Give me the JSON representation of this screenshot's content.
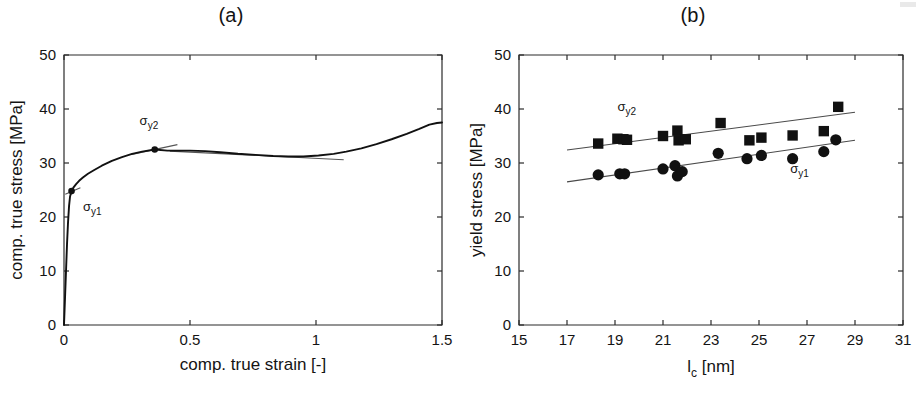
{
  "figure": {
    "background": "#ffffff",
    "ink_color": "#141414"
  },
  "panels": [
    {
      "id": "panel-a",
      "title": "(a)",
      "xlabel": "comp. true strain [-]",
      "ylabel": "comp. true stress [MPa]",
      "xlim": [
        0,
        1.5
      ],
      "ylim": [
        0,
        50
      ],
      "xticks": [
        0,
        0.5,
        1,
        1.5
      ],
      "xticklabels": [
        "0",
        "0.5",
        "1",
        "1.5"
      ],
      "yticks": [
        0,
        10,
        20,
        30,
        40,
        50
      ],
      "yticklabels": [
        "0",
        "10",
        "20",
        "30",
        "40",
        "50"
      ],
      "annotations": [
        {
          "name": "sigma-y1",
          "symbol": "σ",
          "subscript": "y1",
          "point": [
            0.03,
            24.8
          ],
          "label_pos": [
            0.075,
            21.2
          ]
        },
        {
          "name": "sigma-y2",
          "symbol": "σ",
          "subscript": "y2",
          "point": [
            0.36,
            32.5
          ],
          "label_pos": [
            0.3,
            37.0
          ]
        }
      ]
    },
    {
      "id": "panel-b",
      "title": "(b)",
      "xlabel": "l_c [nm]",
      "xlabel_main": "l",
      "xlabel_sub": "c",
      "xlabel_unit": "[nm]",
      "ylabel": "yield stress [MPa]",
      "xlim": [
        15,
        31
      ],
      "ylim": [
        0,
        50
      ],
      "xticks": [
        15,
        17,
        19,
        21,
        23,
        25,
        27,
        29,
        31
      ],
      "xticklabels": [
        "15",
        "17",
        "19",
        "21",
        "23",
        "25",
        "27",
        "29",
        "31"
      ],
      "yticks": [
        0,
        10,
        20,
        30,
        40,
        50
      ],
      "yticklabels": [
        "0",
        "10",
        "20",
        "30",
        "40",
        "50"
      ],
      "annotations": [
        {
          "name": "sigma-y2",
          "symbol": "σ",
          "subscript": "y2",
          "label_pos": [
            19.1,
            39.6
          ]
        },
        {
          "name": "sigma-y1",
          "symbol": "σ",
          "subscript": "y1",
          "label_pos": [
            26.3,
            28.2
          ]
        }
      ]
    }
  ],
  "chart_data": [
    {
      "type": "line",
      "title": "(a)",
      "xlabel": "comp. true strain [-]",
      "ylabel": "comp. true stress [MPa]",
      "xlim": [
        0,
        1.5
      ],
      "ylim": [
        0,
        50
      ],
      "grid": false,
      "legend": null,
      "series": [
        {
          "name": "compressive true stress-strain curve",
          "x": [
            0.0,
            0.004,
            0.008,
            0.012,
            0.016,
            0.02,
            0.024,
            0.03,
            0.038,
            0.048,
            0.06,
            0.075,
            0.095,
            0.12,
            0.15,
            0.19,
            0.23,
            0.27,
            0.31,
            0.36,
            0.41,
            0.46,
            0.5,
            0.56,
            0.62,
            0.69,
            0.76,
            0.83,
            0.89,
            0.95,
            1.01,
            1.07,
            1.12,
            1.18,
            1.24,
            1.3,
            1.36,
            1.41,
            1.45,
            1.48,
            1.5
          ],
          "y": [
            0.0,
            5.0,
            10.0,
            15.0,
            19.0,
            22.0,
            23.8,
            24.8,
            25.5,
            26.1,
            26.7,
            27.3,
            28.0,
            28.7,
            29.5,
            30.4,
            31.1,
            31.7,
            32.1,
            32.5,
            32.3,
            32.3,
            32.3,
            32.2,
            32.0,
            31.7,
            31.5,
            31.3,
            31.2,
            31.2,
            31.4,
            31.7,
            32.1,
            32.7,
            33.5,
            34.4,
            35.4,
            36.3,
            37.1,
            37.4,
            37.5
          ]
        }
      ],
      "annotations": [
        {
          "label": "σy1",
          "x": 0.03,
          "y": 24.8,
          "note": "first yield point marker with tangent"
        },
        {
          "label": "σy2",
          "x": 0.36,
          "y": 32.5,
          "note": "second yield point marker with tangent"
        }
      ],
      "tangents": [
        {
          "name": "tangent-y1",
          "x1": 0.005,
          "y1": 24.2,
          "x2": 0.065,
          "y2": 25.4
        },
        {
          "name": "tangent-y2",
          "x1": 0.27,
          "y1": 31.6,
          "x2": 0.45,
          "y2": 33.4
        },
        {
          "name": "tangent-plateau",
          "x1": 0.42,
          "y1": 32.2,
          "x2": 1.11,
          "y2": 30.6
        }
      ]
    },
    {
      "type": "scatter",
      "title": "(b)",
      "xlabel": "l_c [nm]",
      "ylabel": "yield stress [MPa]",
      "xlim": [
        15,
        31
      ],
      "ylim": [
        0,
        50
      ],
      "grid": false,
      "legend": "inline annotations",
      "series": [
        {
          "name": "σy2",
          "marker": "square",
          "points": [
            [
              18.3,
              33.6
            ],
            [
              19.1,
              34.5
            ],
            [
              19.35,
              34.4
            ],
            [
              19.5,
              34.3
            ],
            [
              21.0,
              35.0
            ],
            [
              21.6,
              36.0
            ],
            [
              21.65,
              34.2
            ],
            [
              21.95,
              34.4
            ],
            [
              23.4,
              37.4
            ],
            [
              24.6,
              34.2
            ],
            [
              25.1,
              34.7
            ],
            [
              26.4,
              35.1
            ],
            [
              27.7,
              35.9
            ],
            [
              28.3,
              40.4
            ]
          ]
        },
        {
          "name": "σy1",
          "marker": "circle",
          "points": [
            [
              18.3,
              27.8
            ],
            [
              19.2,
              28.0
            ],
            [
              19.4,
              28.0
            ],
            [
              21.0,
              28.9
            ],
            [
              21.5,
              29.5
            ],
            [
              21.6,
              27.6
            ],
            [
              21.8,
              28.4
            ],
            [
              23.3,
              31.8
            ],
            [
              24.5,
              30.8
            ],
            [
              25.1,
              31.4
            ],
            [
              26.4,
              30.8
            ],
            [
              27.7,
              32.1
            ],
            [
              28.2,
              34.3
            ]
          ]
        }
      ],
      "fits": [
        {
          "name": "fit-sigma-y2",
          "x1": 17.0,
          "y1": 32.4,
          "x2": 29.0,
          "y2": 39.4
        },
        {
          "name": "fit-sigma-y1",
          "x1": 17.0,
          "y1": 26.5,
          "x2": 29.0,
          "y2": 34.2
        }
      ],
      "annotations": [
        {
          "label": "σy2",
          "x": 19.1,
          "y": 39.6
        },
        {
          "label": "σy1",
          "x": 26.3,
          "y": 28.2
        }
      ]
    }
  ]
}
